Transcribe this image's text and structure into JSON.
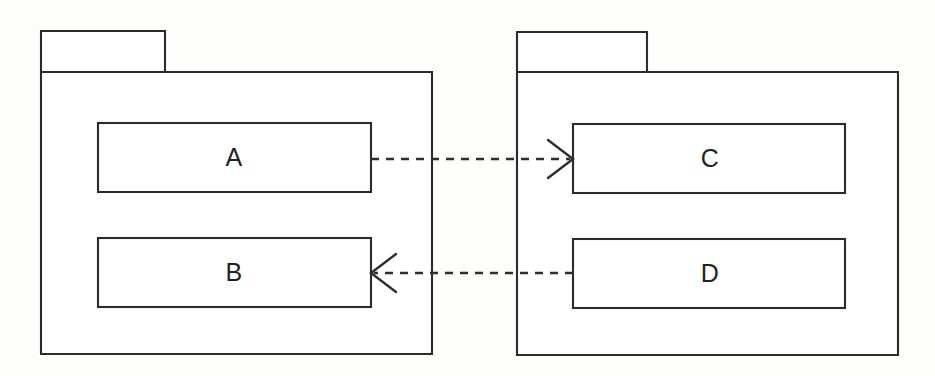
{
  "diagram": {
    "type": "uml-package-dependency-diagram",
    "title": "",
    "background_color": "#fdfdfc",
    "line_color": "#2b2b2b",
    "fill_color": "#ffffff",
    "packages": [
      {
        "id": "left-package",
        "name": "",
        "tab_label": "",
        "body": {
          "x": 41,
          "y": 72,
          "width": 391,
          "height": 282
        },
        "tab": {
          "x": 41,
          "y": 31,
          "width": 124,
          "height": 41
        },
        "classes": [
          "A",
          "B"
        ]
      },
      {
        "id": "right-package",
        "name": "",
        "tab_label": "",
        "body": {
          "x": 517,
          "y": 72,
          "width": 381,
          "height": 283
        },
        "tab": {
          "x": 517,
          "y": 32,
          "width": 130,
          "height": 40
        },
        "classes": [
          "C",
          "D"
        ]
      }
    ],
    "classes": [
      {
        "id": "class-a",
        "label": "A",
        "package": "left-package",
        "x": 98,
        "y": 123,
        "width": 273,
        "height": 69
      },
      {
        "id": "class-b",
        "label": "B",
        "package": "left-package",
        "x": 98,
        "y": 238,
        "width": 273,
        "height": 69
      },
      {
        "id": "class-c",
        "label": "C",
        "package": "right-package",
        "x": 573,
        "y": 124,
        "width": 272,
        "height": 69
      },
      {
        "id": "class-d",
        "label": "D",
        "package": "right-package",
        "x": 573,
        "y": 239,
        "width": 272,
        "height": 69
      }
    ],
    "dependencies": [
      {
        "id": "dep-a-to-c",
        "from": "A",
        "to": "C",
        "label": "",
        "style": "dashed",
        "arrowhead": "open",
        "direction": "right",
        "start": {
          "x": 371,
          "y": 159
        },
        "end": {
          "x": 573,
          "y": 159
        }
      },
      {
        "id": "dep-d-to-b",
        "from": "D",
        "to": "B",
        "label": "",
        "style": "dashed",
        "arrowhead": "open",
        "direction": "left",
        "start": {
          "x": 573,
          "y": 273
        },
        "end": {
          "x": 371,
          "y": 273
        }
      }
    ]
  }
}
